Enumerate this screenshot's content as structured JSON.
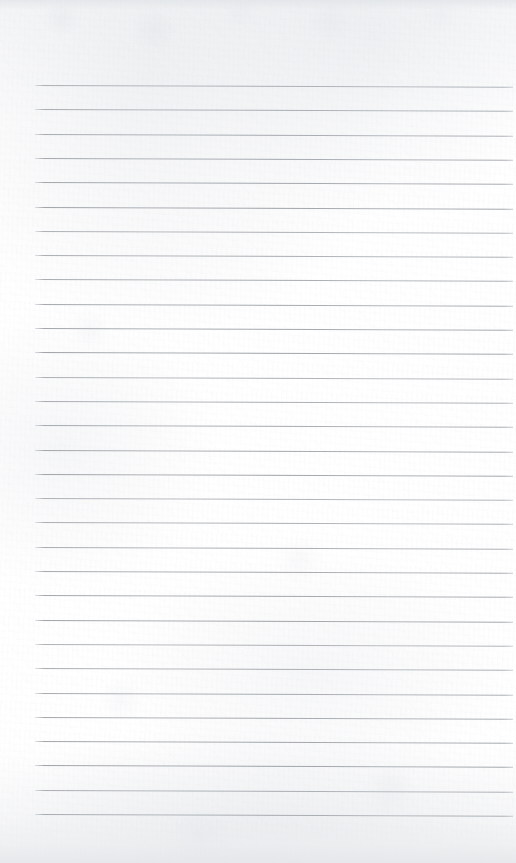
{
  "document": {
    "kind": "scanned-lined-notebook-page",
    "title": "Blank Ruled Notebook Page",
    "page_width": 516,
    "page_height": 863,
    "content_text": "",
    "has_handwriting": false,
    "has_printed_text": false
  },
  "paper": {
    "background_color": "#fdfdfd",
    "base_tone": "#ffffff",
    "edge_shade_color": "#e5e7ea",
    "texture": "subtle-scan-mottling"
  },
  "ruling": {
    "line_color": "#9aa0a6",
    "line_thickness_px": 1,
    "line_count": 31,
    "first_line_y": 85,
    "line_spacing_px": 24.3,
    "left_margin_x": 35,
    "right_end_x": 513,
    "tilt_deg": 0.22,
    "margin_rule": "none",
    "lines_y": [
      85,
      109.3,
      133.6,
      157.9,
      182.2,
      206.5,
      230.8,
      255.1,
      279.4,
      303.7,
      328,
      352.3,
      376.6,
      400.9,
      425.2,
      449.5,
      473.8,
      498.1,
      522.4,
      546.7,
      571,
      595.3,
      619.6,
      643.9,
      668.2,
      692.5,
      716.8,
      741.1,
      765.4,
      789.7,
      814
    ]
  }
}
